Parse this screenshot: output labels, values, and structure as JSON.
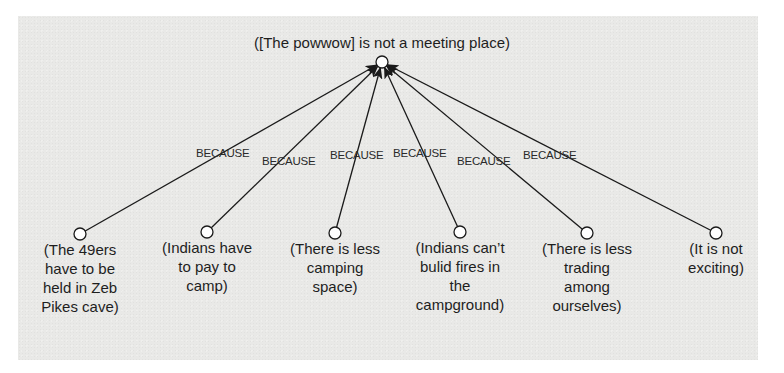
{
  "diagram": {
    "type": "argument-tree",
    "colors": {
      "panel": "#e9e9e7",
      "line": "#1a1a1a",
      "node_fill": "#ffffff",
      "text": "#1e1e1e"
    },
    "root": {
      "label": "([The powwow] is not a meeting place)",
      "node": {
        "x": 382,
        "y": 62
      }
    },
    "edge_label": "BECAUSE",
    "children": [
      {
        "lines": [
          "(The 49ers",
          "have to be",
          "held in Zeb",
          "Pikes cave)"
        ],
        "node": {
          "x": 80,
          "y": 234
        },
        "because": {
          "text": "BECAUSE",
          "x": 196,
          "y": 147
        }
      },
      {
        "lines": [
          "(Indians have",
          "to pay to",
          "camp)"
        ],
        "node": {
          "x": 207,
          "y": 232
        },
        "because": {
          "text": "BECAUSE",
          "x": 262,
          "y": 155
        }
      },
      {
        "lines": [
          "(There is less",
          "camping",
          "space)"
        ],
        "node": {
          "x": 335,
          "y": 233
        },
        "because": {
          "text": "BECAUSE",
          "x": 330,
          "y": 149
        }
      },
      {
        "lines": [
          "(Indians can’t",
          "bulid fires in",
          "the",
          "campground)"
        ],
        "node": {
          "x": 460,
          "y": 232
        },
        "because": {
          "text": "BECAUSE",
          "x": 393,
          "y": 147
        }
      },
      {
        "lines": [
          "(There is less",
          "trading",
          "among",
          "ourselves)"
        ],
        "node": {
          "x": 587,
          "y": 233
        },
        "because": {
          "text": "BECAUSE",
          "x": 457,
          "y": 155
        }
      },
      {
        "lines": [
          "(It is not",
          "exciting)"
        ],
        "node": {
          "x": 716,
          "y": 233
        },
        "because": {
          "text": "BECAUSE",
          "x": 523,
          "y": 149
        }
      }
    ]
  }
}
